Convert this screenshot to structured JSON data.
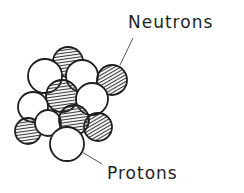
{
  "diagram": {
    "labels": {
      "neutrons": "Neutrons",
      "protons": "Protons"
    },
    "colors": {
      "stroke": "#1f1f1f",
      "hatch": "#3a3a3a",
      "proton_fill": "#ffffff",
      "leader_line": "#555555"
    },
    "particles": [
      {
        "type": "neutron",
        "cx": 68,
        "cy": 62,
        "r": 15
      },
      {
        "type": "proton",
        "cx": 45,
        "cy": 76,
        "r": 17
      },
      {
        "type": "proton",
        "cx": 82,
        "cy": 76,
        "r": 16
      },
      {
        "type": "neutron",
        "cx": 112,
        "cy": 80,
        "r": 15
      },
      {
        "type": "neutron",
        "cx": 62,
        "cy": 96,
        "r": 16
      },
      {
        "type": "proton",
        "cx": 92,
        "cy": 99,
        "r": 16
      },
      {
        "type": "proton",
        "cx": 33,
        "cy": 107,
        "r": 15
      },
      {
        "type": "neutron",
        "cx": 98,
        "cy": 127,
        "r": 14
      },
      {
        "type": "neutron",
        "cx": 28,
        "cy": 131,
        "r": 13
      },
      {
        "type": "proton",
        "cx": 48,
        "cy": 123,
        "r": 13
      },
      {
        "type": "neutron",
        "cx": 74,
        "cy": 120,
        "r": 15
      },
      {
        "type": "proton",
        "cx": 67,
        "cy": 144,
        "r": 17
      }
    ],
    "leaders": {
      "neutrons": {
        "x1": 120,
        "y1": 65,
        "x2": 133,
        "y2": 38
      },
      "protons": {
        "x1": 82,
        "y1": 152,
        "x2": 102,
        "y2": 164
      }
    }
  }
}
